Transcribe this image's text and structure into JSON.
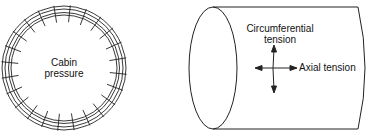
{
  "left_figure": {
    "label_line1": "Cabin",
    "label_line2": "pressure"
  },
  "right_figure": {
    "circ_line1": "Circumferential",
    "circ_line2": "tension",
    "axial": "Axial tension"
  },
  "colors": {
    "stroke": "#222222",
    "background": "#ffffff"
  }
}
